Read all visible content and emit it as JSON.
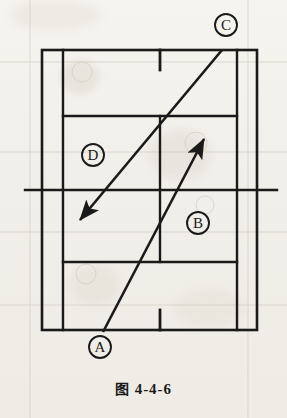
{
  "figure": {
    "caption_prefix": "图",
    "caption_number": "4-4-6",
    "caption_full": "图 4-4-6",
    "type": "tennis-court-diagram",
    "background_color": "#f1efe9",
    "line_color": "#1a1a1a"
  },
  "court": {
    "outer_left_x": 42,
    "outer_right_x": 257,
    "top_baseline_y": 50,
    "bottom_baseline_y": 330,
    "singles_left_x": 63,
    "singles_right_x": 237,
    "upper_service_line_y": 116,
    "lower_service_line_y": 262,
    "center_service_line_x": 160,
    "net_line_y": 190,
    "net_line_left_x": 25,
    "net_line_right_x": 277,
    "center_mark_x": 160,
    "labels": {
      "doubles_sideline": "doubles-sideline",
      "singles_sideline": "singles-sideline",
      "baseline": "baseline",
      "service_line": "service-line",
      "center_service_line": "center-service-line",
      "center_mark": "center-mark",
      "net": "net-line"
    }
  },
  "markers": [
    {
      "id": "A",
      "label": "A",
      "x": 100,
      "y": 347,
      "radius": 11
    },
    {
      "id": "B",
      "label": "B",
      "x": 198,
      "y": 223,
      "radius": 11
    },
    {
      "id": "C",
      "label": "C",
      "x": 226,
      "y": 25,
      "radius": 11
    },
    {
      "id": "D",
      "label": "D",
      "x": 93,
      "y": 155,
      "radius": 11
    }
  ],
  "arrows": [
    {
      "id": "arrow-a-to-b",
      "from_label": "A",
      "to_label": "B",
      "start": {
        "x": 103,
        "y": 332
      },
      "end": {
        "x": 206,
        "y": 136
      },
      "direction": "up-right",
      "arrowhead_at": "end"
    },
    {
      "id": "arrow-c-to-d",
      "from_label": "C",
      "to_label": "D",
      "start": {
        "x": 222,
        "y": 50
      },
      "end": {
        "x": 78,
        "y": 222
      },
      "direction": "down-left",
      "arrowhead_at": "end"
    }
  ]
}
